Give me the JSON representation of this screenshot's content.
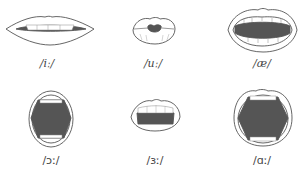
{
  "figures": [
    {
      "id": "i-long",
      "label": "/iː/",
      "shape": "spread-lips"
    },
    {
      "id": "u-long",
      "label": "/uː/",
      "shape": "rounded-lips"
    },
    {
      "id": "ae",
      "label": "/æ/",
      "shape": "open-mouth"
    },
    {
      "id": "open-o-long",
      "label": "/ɔː/",
      "shape": "rounded-open-mouth"
    },
    {
      "id": "er-long",
      "label": "/ɜː/",
      "shape": "half-open-lips"
    },
    {
      "id": "a-long",
      "label": "/ɑː/",
      "shape": "wide-open-mouth"
    }
  ],
  "colors": {
    "stroke": "#555555",
    "mouth_fill": "#555555",
    "background": "#ffffff"
  }
}
